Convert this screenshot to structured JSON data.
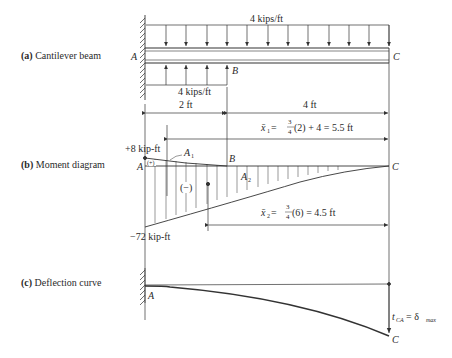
{
  "panels": {
    "a": {
      "tag": "(a)",
      "label": "Cantilever beam"
    },
    "b": {
      "tag": "(b)",
      "label": "Moment diagram"
    },
    "c": {
      "tag": "(c)",
      "label": "Deflection curve"
    }
  },
  "points": {
    "A": "A",
    "B": "B",
    "C": "C"
  },
  "loads": {
    "top": "4 kips/ft",
    "bottom": "4 kips/ft"
  },
  "dimensions": {
    "left": "2 ft",
    "right": "4 ft"
  },
  "centroids": {
    "x1": {
      "symbol": "x̄",
      "sub": "1",
      "eq": " = ",
      "num": "3",
      "den": "4",
      "tail": " (2) + 4 = 5.5 ft"
    },
    "x2": {
      "symbol": "x̄",
      "sub": "2",
      "eq": " = ",
      "num": "3",
      "den": "4",
      "tail": " (6) = 4.5 ft"
    }
  },
  "moment": {
    "pos_value": "+8 kip-ft",
    "neg_value": "−72 kip-ft",
    "area1": "A",
    "area1_sub": "1",
    "area2": "A",
    "area2_sub": "2",
    "pos_sign": "(+)",
    "neg_sign": "(−)"
  },
  "deflection": {
    "t": "t",
    "t_sub": "CA",
    "eq": " = δ",
    "max_sub": "max"
  }
}
